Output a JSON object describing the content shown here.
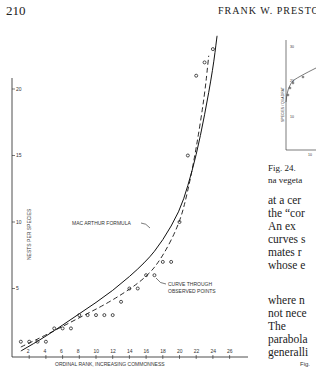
{
  "page": {
    "page_number": "210",
    "running_header": "FRANK W. PRESTON"
  },
  "chart_data": {
    "type": "scatter",
    "title": "",
    "xlabel": "ORDINAL RANK, INCREASING COMMONNESS",
    "ylabel": "NESTS PER SPECIES",
    "x_ticks": [
      2,
      4,
      6,
      8,
      10,
      12,
      14,
      16,
      18,
      20,
      22,
      24,
      26
    ],
    "y_ticks": [
      5,
      10,
      15,
      20
    ],
    "xlim": [
      0,
      27
    ],
    "ylim": [
      0,
      22
    ],
    "grid": false,
    "annotations": [
      "MAC ARTHUR FORMULA",
      "CURVE THROUGH OBSERVED POINTS"
    ],
    "series": [
      {
        "name": "Observed points",
        "style": "open-circle",
        "x": [
          1,
          2,
          3,
          4,
          5,
          6,
          7,
          8,
          9,
          10,
          11,
          12,
          13,
          14,
          15,
          16,
          17,
          18,
          19,
          20,
          21,
          22,
          23,
          24
        ],
        "y": [
          1,
          1,
          1,
          1,
          2,
          2,
          2,
          3,
          3,
          3,
          3,
          3,
          4,
          5,
          5,
          6,
          6,
          7,
          7,
          10,
          15,
          21,
          22,
          23
        ]
      },
      {
        "name": "MAC ARTHUR FORMULA",
        "style": "solid",
        "x": [
          1,
          4,
          8,
          12,
          16,
          18,
          20,
          21,
          22,
          23,
          24,
          24.5
        ],
        "y": [
          0.3,
          1.4,
          3.1,
          4.8,
          7.0,
          8.6,
          10.8,
          12.7,
          15.0,
          18.0,
          21.5,
          24
        ]
      },
      {
        "name": "CURVE THROUGH OBSERVED POINTS",
        "style": "dashed",
        "x": [
          1,
          4,
          8,
          12,
          16,
          18,
          20,
          21,
          22,
          23,
          23.5
        ],
        "y": [
          0.6,
          1.5,
          2.8,
          4.1,
          5.8,
          7.4,
          9.9,
          12.3,
          15.5,
          19.5,
          22.5
        ]
      }
    ]
  },
  "side_figure": {
    "ylabel": "SPECIES / QUADRAT",
    "y_ticks": [
      "30",
      "20",
      "10"
    ],
    "x_tick": "10"
  },
  "caption": {
    "fig_prefix": "Fig.",
    "right_caption_line1": "Fig. 24.",
    "right_caption_line2": "na vegeta"
  },
  "body_text": {
    "lines": [
      "at a cer",
      "the “cor",
      "  An ex",
      "curves s",
      "mates r",
      "whose e",
      "where n",
      "not nece",
      "  The",
      "parabola",
      "generalli"
    ]
  }
}
